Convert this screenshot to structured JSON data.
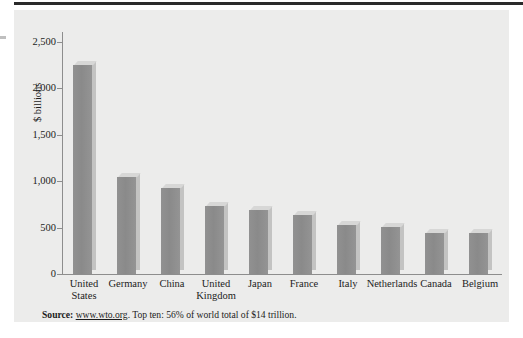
{
  "figure": {
    "y_axis_title": "$ billions",
    "source_prefix": "Source:",
    "source_link": "www.wto.org",
    "source_rest": ". Top ten: 56% of world total of $14 trillion."
  },
  "chart_data": {
    "type": "bar",
    "title": "",
    "xlabel": "",
    "ylabel": "$ billions",
    "ylim": [
      0,
      2500
    ],
    "yticks": [
      0,
      500,
      1000,
      1500,
      2000,
      2500
    ],
    "ytick_labels": [
      "0",
      "500",
      "1,000",
      "1,500",
      "2,000",
      "2,500"
    ],
    "grid": false,
    "legend": null,
    "categories": [
      "United States",
      "Germany",
      "China",
      "United Kingdom",
      "Japan",
      "France",
      "Italy",
      "Netherlands",
      "Canada",
      "Belgium"
    ],
    "values": [
      2250,
      1050,
      930,
      730,
      690,
      640,
      525,
      510,
      445,
      440
    ],
    "bar_color": "#8e8e8e",
    "panel_color": "#ececeb",
    "axis_color": "#8d8d8d",
    "annotation": "Source: www.wto.org. Top ten: 56% of world total of $14 trillion."
  }
}
